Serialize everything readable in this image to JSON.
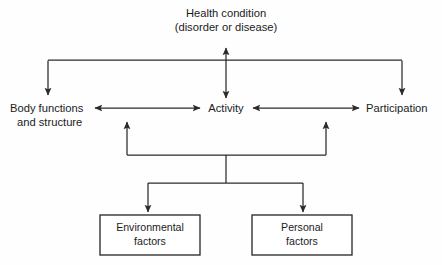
{
  "diagram": {
    "title_semantic": "icf-model-interaction-of-components",
    "nodes": {
      "health_condition": {
        "line1": "Health condition",
        "line2": "(disorder or disease)"
      },
      "body_functions": {
        "line1": "Body functions",
        "line2": "and structure"
      },
      "activity": {
        "line1": "Activity"
      },
      "participation": {
        "line1": "Participation"
      }
    },
    "boxes": [
      {
        "id": "environmental-factors",
        "line1": "Environmental",
        "line2": "factors"
      },
      {
        "id": "personal-factors",
        "line1": "Personal",
        "line2": "factors"
      }
    ],
    "colors": {
      "background": "#fefefe",
      "stroke": "#2b2b2b",
      "text": "#1b1b1b",
      "box_fill": "#ffffff"
    }
  }
}
